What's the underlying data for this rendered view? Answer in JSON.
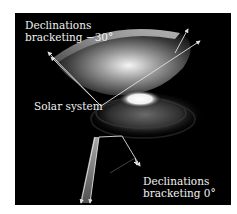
{
  "figure": {
    "labels": {
      "top_line1": "Declinations",
      "top_line2": "bracketing −30°",
      "solar_system": "Solar system",
      "bottom_line1": "Declinations",
      "bottom_line2": "bracketing 0°"
    },
    "colors": {
      "background": "#000000",
      "page": "#ffffff",
      "text": "#f2f2f2",
      "arrows": "#e0e0e0"
    }
  }
}
